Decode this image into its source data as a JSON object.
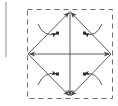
{
  "figure": {
    "title": "",
    "caption": "",
    "background_color": "#ffffff",
    "stroke_color": "#4a4a4a",
    "dash_color": "#6e6e6e",
    "marker_color": "#2b2b2b",
    "panel_edge_color": "#8d8d8d"
  },
  "left_panel_edge": {
    "label": "",
    "x": 6,
    "y_top": 2,
    "y_bottom": 57,
    "style": "solid"
  },
  "dashed_frame": {
    "label": "",
    "x": 27,
    "y": 9,
    "width": 86,
    "height": 90,
    "style": "dashed",
    "dash_pattern": "5 4"
  },
  "diamond": {
    "label": "",
    "vertices": {
      "top": {
        "x": 70,
        "y": 11
      },
      "right": {
        "x": 111,
        "y": 54
      },
      "bottom": {
        "x": 70,
        "y": 97
      },
      "left": {
        "x": 28,
        "y": 54
      }
    },
    "edges": [
      {
        "name": "top-left-edge",
        "from": "left",
        "to": "top",
        "arrow_at": "top"
      },
      {
        "name": "top-right-edge",
        "from": "right",
        "to": "top",
        "arrow_at": "top"
      },
      {
        "name": "bottom-left-edge",
        "from": "left",
        "to": "bottom",
        "arrow_at": "bottom"
      },
      {
        "name": "bottom-right-edge",
        "from": "right",
        "to": "bottom",
        "arrow_at": "bottom"
      }
    ]
  },
  "center_cross": {
    "label": "",
    "center": {
      "x": 70,
      "y": 54
    },
    "vertical": {
      "x": 70,
      "y1": 11,
      "y2": 97,
      "arrow_at": "bottom"
    },
    "horizontal": {
      "y": 54,
      "x1": 28,
      "x2": 111,
      "arrow_at": "both"
    }
  },
  "quadrant_arcs": [
    {
      "name": "arc-upper-left",
      "quadrant": "upper-left",
      "start": {
        "x": 38,
        "y": 24
      },
      "control": {
        "x": 44,
        "y": 38
      },
      "end": {
        "x": 58,
        "y": 34
      },
      "arrow_at_end": true,
      "marker": {
        "x": 57,
        "y": 33
      }
    },
    {
      "name": "arc-upper-right",
      "quadrant": "upper-right",
      "start": {
        "x": 102,
        "y": 24
      },
      "control": {
        "x": 96,
        "y": 38
      },
      "end": {
        "x": 83,
        "y": 34
      },
      "arrow_at_end": true,
      "marker": {
        "x": 84,
        "y": 33
      }
    },
    {
      "name": "arc-lower-left",
      "quadrant": "lower-left",
      "start": {
        "x": 38,
        "y": 85
      },
      "control": {
        "x": 44,
        "y": 71
      },
      "end": {
        "x": 58,
        "y": 74
      },
      "arrow_at_end": true,
      "marker": {
        "x": 57,
        "y": 74
      }
    },
    {
      "name": "arc-lower-right",
      "quadrant": "lower-right",
      "start": {
        "x": 102,
        "y": 85
      },
      "control": {
        "x": 96,
        "y": 71
      },
      "end": {
        "x": 83,
        "y": 74
      },
      "arrow_at_end": true,
      "marker": {
        "x": 84,
        "y": 74
      }
    }
  ]
}
